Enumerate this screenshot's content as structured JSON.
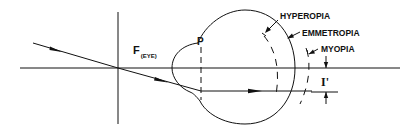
{
  "diagram": {
    "labels": {
      "focal_point": "F",
      "focal_point_subscript": "(EYE)",
      "principal_plane": "P",
      "hyperopia": "HYPEROPIA",
      "emmetropia": "EMMETROPIA",
      "myopia": "MYOPIA",
      "image_height": "I'"
    },
    "colors": {
      "stroke": "#111111",
      "background": "#ffffff"
    }
  }
}
